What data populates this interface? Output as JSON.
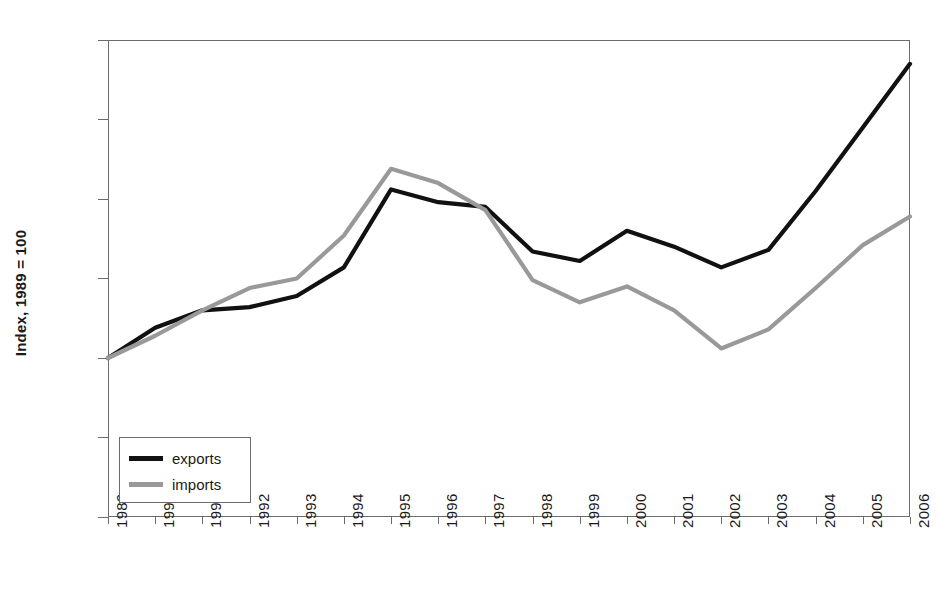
{
  "chart_data": {
    "type": "line",
    "title": "",
    "xlabel": "",
    "ylabel": "Index, 1989 = 100",
    "x": [
      1989,
      1990,
      1991,
      1992,
      1993,
      1994,
      1995,
      1996,
      1997,
      1998,
      1999,
      2000,
      2001,
      2002,
      2003,
      2004,
      2005,
      2006
    ],
    "categories": [
      "1989",
      "1990",
      "1991",
      "1992",
      "1993",
      "1994",
      "1995",
      "1996",
      "1997",
      "1998",
      "1999",
      "2000",
      "2001",
      "2002",
      "2003",
      "2004",
      "2005",
      "2006"
    ],
    "series": [
      {
        "name": "exports",
        "color": "#111111",
        "values": [
          100.0,
          101.9,
          103.0,
          103.2,
          103.9,
          105.7,
          110.6,
          109.8,
          109.5,
          106.7,
          106.1,
          108.0,
          107.0,
          105.7,
          106.8,
          110.5,
          114.5,
          118.5
        ]
      },
      {
        "name": "imports",
        "color": "#999999",
        "values": [
          100.0,
          101.4,
          103.0,
          104.4,
          105.0,
          107.7,
          111.9,
          111.0,
          109.3,
          104.9,
          103.5,
          104.5,
          103.0,
          100.6,
          101.8,
          104.4,
          107.1,
          108.9
        ]
      }
    ],
    "ylim": [
      90,
      120
    ],
    "yticks": [
      90,
      95,
      100,
      105,
      110,
      115,
      120
    ],
    "ytick_labels": [
      "90",
      "95",
      "100",
      "105",
      "110",
      "115",
      "120"
    ],
    "grid": false,
    "legend_position": "lower left",
    "legend_entries": [
      {
        "label": "exports",
        "color": "#111111"
      },
      {
        "label": "imports",
        "color": "#999999"
      }
    ],
    "axis_color": "#6b6b6b",
    "background": "#ffffff"
  }
}
